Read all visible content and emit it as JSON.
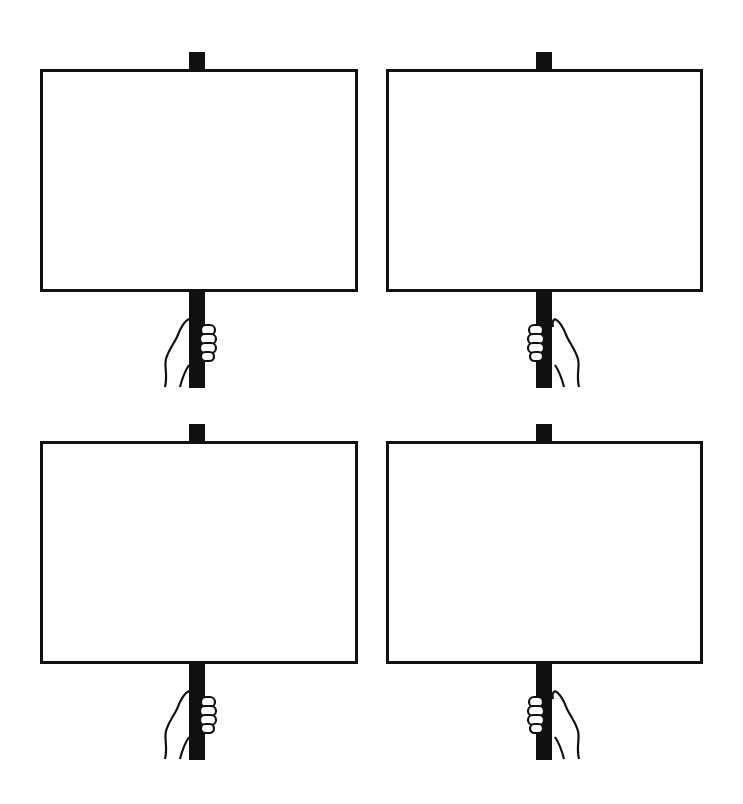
{
  "page": {
    "title": "",
    "background_color": "#ffffff",
    "ink_color": "#111111"
  },
  "signs": [
    {
      "id": "top-left",
      "text": "",
      "hand_side": "right"
    },
    {
      "id": "top-right",
      "text": "",
      "hand_side": "left"
    },
    {
      "id": "bottom-left",
      "text": "",
      "hand_side": "right"
    },
    {
      "id": "bottom-right",
      "text": "",
      "hand_side": "left"
    }
  ]
}
